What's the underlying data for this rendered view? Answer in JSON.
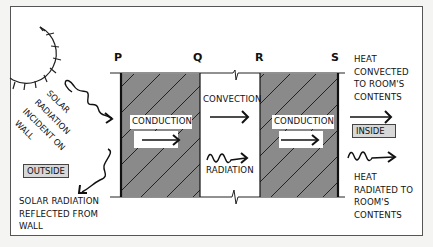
{
  "diagram": {
    "points": [
      "P",
      "Q",
      "R",
      "S"
    ],
    "labels": {
      "solar_incident": [
        "SOLAR",
        "RADIATION",
        "INCIDENT ON",
        "WALL"
      ],
      "solar_reflected": [
        "SOLAR RADIATION",
        "REFLECTED FROM",
        "WALL"
      ],
      "outside": "OUTSIDE",
      "inside": "INSIDE",
      "conduction_left": "CONDUCTION",
      "conduction_right": "CONDUCTION",
      "convection": "CONVECTION",
      "radiation": "RADIATION",
      "heat_convected": [
        "HEAT",
        "CONVECTED",
        "TO ROOM'S",
        "CONTENTS"
      ],
      "heat_radiated": [
        "HEAT",
        "RADIATED TO",
        "ROOM'S",
        "CONTENTS"
      ]
    },
    "colors": {
      "wall_fill": "#8a8a8a",
      "hatch": "#222222",
      "label_box": "#d8d8d8",
      "ink": "#111111"
    }
  }
}
